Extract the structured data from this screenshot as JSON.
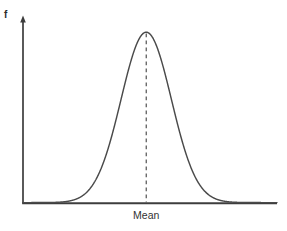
{
  "figure": {
    "background_color": "#ffffff",
    "width": 287,
    "height": 231
  },
  "labels": {
    "y_axis_label": "f",
    "x_axis_label": "Mean"
  },
  "colors": {
    "curve": "#4a4a4a",
    "axis": "#3d3d3d",
    "dashed_line": "#4a4a4a",
    "text": "#2b2b2b"
  },
  "chart_data": {
    "type": "line",
    "title": "",
    "xlabel": "Mean",
    "ylabel": "f",
    "grid": false,
    "legend": null,
    "annotations": [
      {
        "name": "mean-dashed-line",
        "kind": "vertical-dashed-line",
        "x": 0,
        "from_y": 0,
        "to_y": 1.0,
        "label": "Mean"
      }
    ],
    "axis": {
      "x_axis_arrow": false,
      "y_axis_arrow": true,
      "x_ticks": [],
      "y_ticks": [],
      "xlim": [
        -4.9,
        5.2
      ],
      "ylim": [
        0,
        1.08
      ]
    },
    "series": [
      {
        "name": "normal-distribution",
        "distribution": "gaussian",
        "mean": 0,
        "sigma": 1,
        "peak_value": 1.0,
        "x": [
          -4.9,
          -4.6,
          -4.3,
          -4.0,
          -3.7,
          -3.4,
          -3.1,
          -2.8,
          -2.5,
          -2.2,
          -1.9,
          -1.6,
          -1.3,
          -1.0,
          -0.7,
          -0.4,
          -0.1,
          0.0,
          0.1,
          0.4,
          0.7,
          1.0,
          1.3,
          1.6,
          1.9,
          2.2,
          2.5,
          2.8,
          3.1,
          3.4,
          3.7,
          4.0,
          4.3,
          4.6,
          4.9,
          5.2
        ],
        "y": [
          0.0,
          0.0,
          0.001,
          0.0003,
          0.001,
          0.003,
          0.008,
          0.02,
          0.044,
          0.089,
          0.165,
          0.278,
          0.43,
          0.607,
          0.783,
          0.923,
          0.995,
          1.0,
          0.995,
          0.923,
          0.783,
          0.607,
          0.43,
          0.278,
          0.165,
          0.089,
          0.044,
          0.02,
          0.008,
          0.003,
          0.001,
          0.0003,
          0.001,
          0.0,
          0.0,
          0.0
        ]
      }
    ]
  }
}
